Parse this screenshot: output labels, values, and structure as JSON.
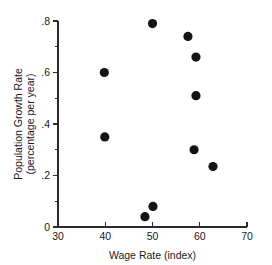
{
  "chart_data": {
    "type": "scatter",
    "title": "",
    "xlabel": "Wage Rate (index)",
    "ylabel_line1": "Population Growth Rate",
    "ylabel_line2": "(percentage per year)",
    "xlim": [
      30,
      70
    ],
    "ylim": [
      0,
      0.8
    ],
    "grid": false,
    "legend": null,
    "x_ticks_major": [
      30,
      40,
      50,
      60,
      70
    ],
    "x_tick_labels": [
      "30",
      "40",
      "50",
      "60",
      "70"
    ],
    "y_ticks_major": [
      0,
      0.2,
      0.4,
      0.6,
      0.8
    ],
    "y_tick_labels": [
      "0",
      ".2",
      ".4",
      ".6",
      ".8"
    ],
    "y_ticks_minor": [
      0.1,
      0.3,
      0.5,
      0.7
    ],
    "marker": "filled-circle",
    "marker_color": "#141414",
    "marker_size": 4.6,
    "points": [
      {
        "x": 39.8,
        "y": 0.6
      },
      {
        "x": 39.9,
        "y": 0.35
      },
      {
        "x": 48.4,
        "y": 0.04
      },
      {
        "x": 50.1,
        "y": 0.08
      },
      {
        "x": 50.0,
        "y": 0.79
      },
      {
        "x": 57.5,
        "y": 0.74
      },
      {
        "x": 59.2,
        "y": 0.66
      },
      {
        "x": 59.2,
        "y": 0.51
      },
      {
        "x": 58.8,
        "y": 0.3
      },
      {
        "x": 62.8,
        "y": 0.235
      }
    ]
  }
}
